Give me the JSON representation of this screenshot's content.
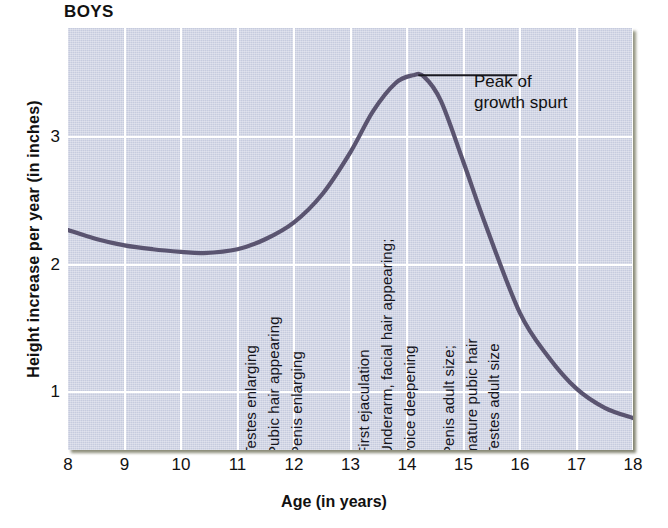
{
  "chart_data": {
    "type": "line",
    "title": "BOYS",
    "xlabel": "Age (in years)",
    "ylabel": "Height increase per year (in inches)",
    "xlim": [
      8,
      18
    ],
    "ylim": [
      0.55,
      3.85
    ],
    "xticks": [
      "8",
      "9",
      "10",
      "11",
      "12",
      "13",
      "14",
      "15",
      "16",
      "17",
      "18"
    ],
    "yticks": [
      "1",
      "2",
      "3"
    ],
    "grid": true,
    "legend": null,
    "line_color": "#5a5470",
    "plot_background": "#c6cbde",
    "gridline_color": "#ffffff",
    "series": [
      {
        "name": "Height increase per year",
        "x": [
          8.0,
          8.5,
          9.0,
          9.5,
          10.0,
          10.4,
          11.0,
          11.5,
          12.0,
          12.5,
          13.0,
          13.4,
          13.8,
          14.1,
          14.3,
          14.6,
          15.0,
          15.4,
          16.0,
          16.5,
          17.0,
          17.5,
          18.0
        ],
        "values": [
          2.27,
          2.2,
          2.15,
          2.12,
          2.1,
          2.09,
          2.12,
          2.2,
          2.33,
          2.55,
          2.88,
          3.2,
          3.42,
          3.48,
          3.47,
          3.28,
          2.8,
          2.3,
          1.62,
          1.28,
          1.03,
          0.88,
          0.8
        ]
      }
    ],
    "annotations": [
      {
        "id": "peak-callout",
        "text_lines": [
          "Peak of",
          "growth spurt"
        ],
        "points_to_x": 14.2,
        "points_to_y": 3.48
      },
      {
        "id": "event-1",
        "text": "Testes enlarging",
        "x": 11.3
      },
      {
        "id": "event-2",
        "text": "Pubic hair appearing",
        "x": 11.7
      },
      {
        "id": "event-3",
        "text": "Penis enlarging",
        "x": 12.1
      },
      {
        "id": "event-4",
        "text": "First ejaculation",
        "x": 13.3
      },
      {
        "id": "event-5",
        "text": "Underarm, facial hair appearing;",
        "x": 13.7
      },
      {
        "id": "event-6",
        "text": "voice deepening",
        "x": 14.1
      },
      {
        "id": "event-7",
        "text": "Penis adult size;",
        "x": 14.8
      },
      {
        "id": "event-8",
        "text": "mature pubic hair",
        "x": 15.2
      },
      {
        "id": "event-9",
        "text": "Testes adult size",
        "x": 15.6
      }
    ]
  }
}
